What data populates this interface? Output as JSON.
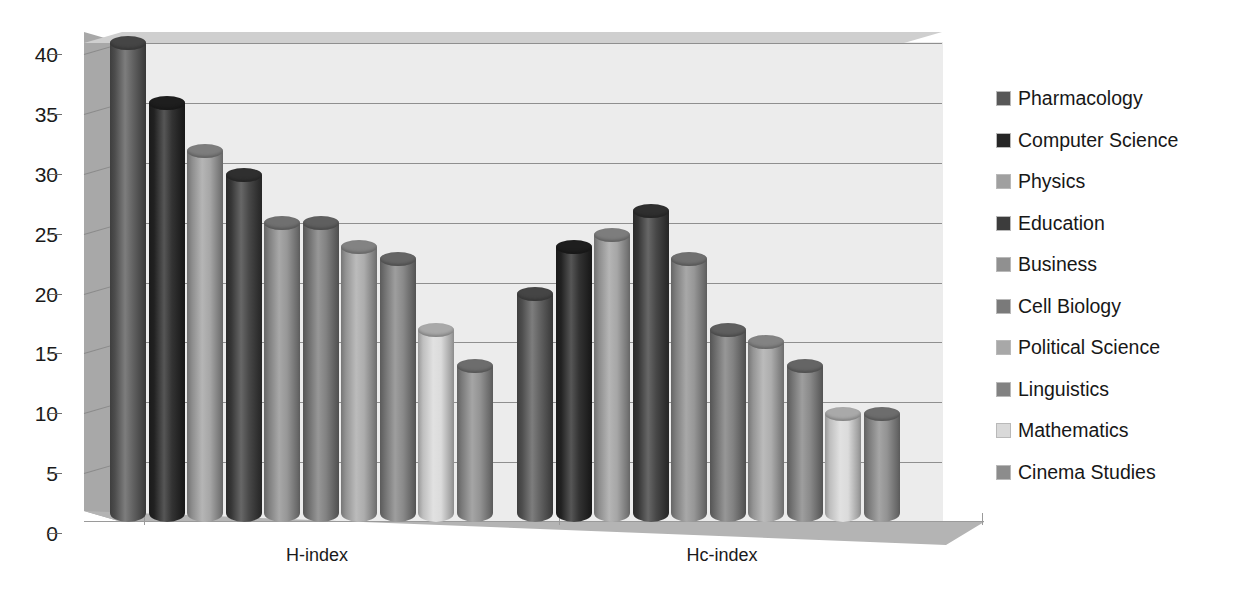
{
  "chart_data": {
    "type": "bar",
    "title": "",
    "subtitle": "",
    "xlabel": "",
    "ylabel": "",
    "categories": [
      "H-index",
      "Hc-index"
    ],
    "ylim": [
      0,
      40
    ],
    "yticks": [
      0,
      5,
      10,
      15,
      20,
      25,
      30,
      35,
      40
    ],
    "ytick_labels": [
      "0",
      "5",
      "10",
      "15",
      "20",
      "25",
      "30",
      "35",
      "40"
    ],
    "grid": true,
    "legend_position": "right",
    "style": "3d-clustered-cylinder",
    "series": [
      {
        "name": "Pharmacology",
        "color": "#585858",
        "values": [
          40,
          19
        ]
      },
      {
        "name": "Computer Science",
        "color": "#262626",
        "values": [
          35,
          23
        ]
      },
      {
        "name": "Physics",
        "color": "#a0a0a0",
        "values": [
          31,
          24
        ]
      },
      {
        "name": "Education",
        "color": "#3c3c3c",
        "values": [
          29,
          26
        ]
      },
      {
        "name": "Business",
        "color": "#909090",
        "values": [
          25,
          22
        ]
      },
      {
        "name": "Cell Biology",
        "color": "#7a7a7a",
        "values": [
          25,
          16
        ]
      },
      {
        "name": "Political Science",
        "color": "#a8a8a8",
        "values": [
          23,
          15
        ]
      },
      {
        "name": "Linguistics",
        "color": "#828282",
        "values": [
          22,
          13
        ]
      },
      {
        "name": "Mathematics",
        "color": "#d9d9d9",
        "values": [
          16,
          9
        ]
      },
      {
        "name": "Cinema Studies",
        "color": "#8c8c8c",
        "values": [
          13,
          9
        ]
      }
    ]
  },
  "legend": {
    "items": [
      {
        "label": "Pharmacology",
        "color": "#585858"
      },
      {
        "label": "Computer Science",
        "color": "#262626"
      },
      {
        "label": "Physics",
        "color": "#a0a0a0"
      },
      {
        "label": "Education",
        "color": "#3c3c3c"
      },
      {
        "label": "Business",
        "color": "#909090"
      },
      {
        "label": "Cell Biology",
        "color": "#7a7a7a"
      },
      {
        "label": "Political Science",
        "color": "#a8a8a8"
      },
      {
        "label": "Linguistics",
        "color": "#828282"
      },
      {
        "label": "Mathematics",
        "color": "#d9d9d9"
      },
      {
        "label": "Cinema Studies",
        "color": "#8c8c8c"
      }
    ]
  },
  "axes": {
    "y_tick_labels": [
      "40",
      "35",
      "30",
      "25",
      "20",
      "15",
      "10",
      "5",
      "0"
    ],
    "x_tick_labels": [
      "H-index",
      "Hc-index"
    ]
  },
  "colors": {
    "plot_background": "#ececec",
    "wall_top": "#cfcfcf",
    "side_wall": "#a8a8a8",
    "floor": "#b4b4b4",
    "gridline": "#8f8f8f",
    "text": "#1a1a1a"
  }
}
